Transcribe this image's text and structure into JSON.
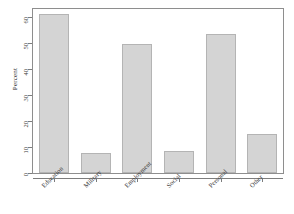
{
  "chart_data": {
    "type": "bar",
    "title": "",
    "subtitle": "",
    "xlabel": "",
    "ylabel": "Percent",
    "categories": [
      "Education",
      "Military",
      "Employment",
      "Social",
      "Personal",
      "Other"
    ],
    "values": [
      61,
      7.5,
      49.5,
      8.5,
      53.5,
      15
    ],
    "ylim": [
      0,
      63
    ],
    "yticks": [
      0,
      10,
      20,
      30,
      40,
      50,
      60
    ],
    "ytick_labels": [
      "0",
      "10",
      "20",
      "30",
      "40",
      "50",
      "60"
    ],
    "grid": false,
    "legend": null,
    "bar_fill_color": "#d4d4d4",
    "bar_border_color": "#b4b4b4",
    "axis_color": "#7d7d7d",
    "frame_color": "#8e8e8e",
    "background_color": "#ffffff",
    "xtick_label_rotation": -45,
    "ytick_label_rotation": -90
  }
}
